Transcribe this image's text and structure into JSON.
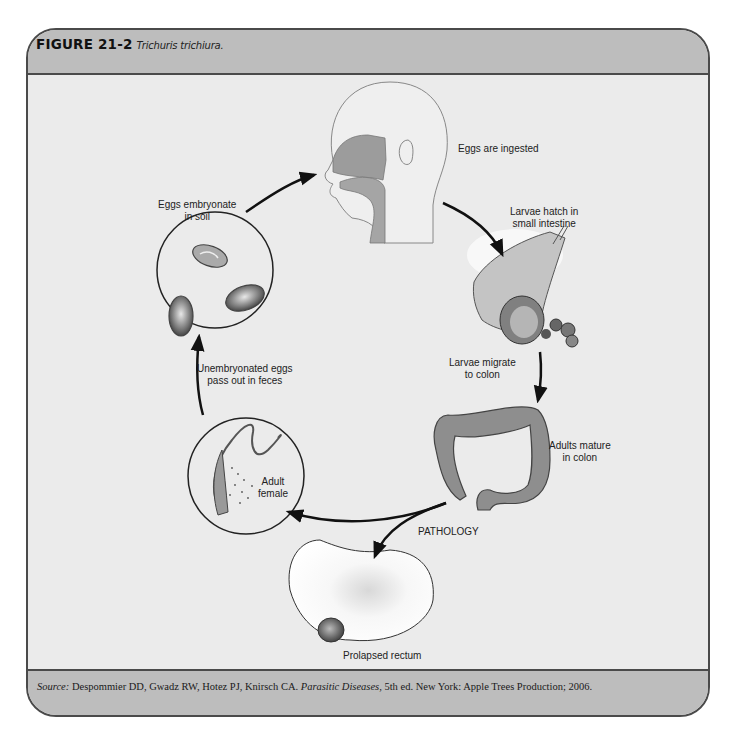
{
  "figure": {
    "number": "FIGURE 21-2",
    "title": "Trichuris trichiura."
  },
  "diagram": {
    "type": "life-cycle",
    "stages": [
      {
        "id": "ingest",
        "label": "Eggs are ingested"
      },
      {
        "id": "hatch",
        "label_line1": "Larvae hatch in",
        "label_line2": "small intestine"
      },
      {
        "id": "migrate",
        "label_line1": "Larvae migrate",
        "label_line2": "to colon"
      },
      {
        "id": "mature",
        "label_line1": "Adults mature",
        "label_line2": "in colon"
      },
      {
        "id": "female",
        "label_line1": "Adult",
        "label_line2": "female"
      },
      {
        "id": "pass",
        "label_line1": "Unembryonated eggs",
        "label_line2": "pass out in feces"
      },
      {
        "id": "embryonate",
        "label_line1": "Eggs embryonate",
        "label_line2": "in soil"
      }
    ],
    "pathology_label": "PATHOLOGY",
    "pathology_result": "Prolapsed rectum"
  },
  "source": {
    "prefix": "Source:",
    "authors": " Despommier DD, Gwadz RW, Hotez PJ, Knirsch CA. ",
    "book": "Parasitic Diseases",
    "rest": ", 5th ed. New York: Apple Trees Production; 2006."
  }
}
